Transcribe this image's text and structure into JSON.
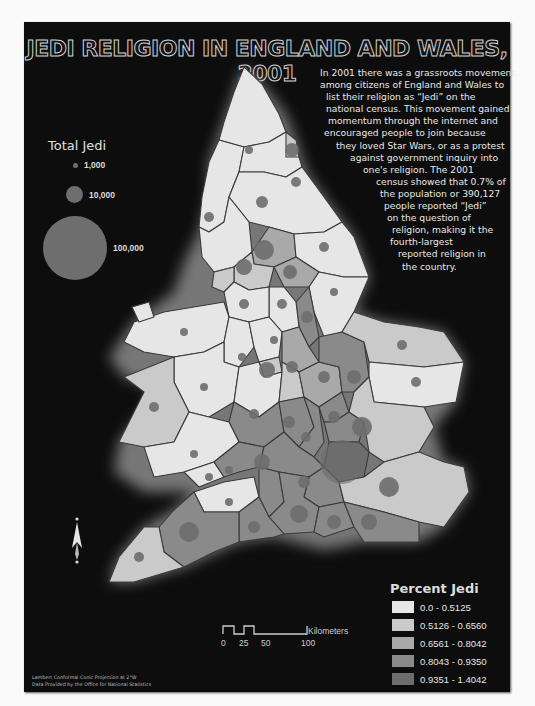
{
  "title": "JEDI RELIGION IN ENGLAND AND WALES, 2001",
  "intro_lines": [
    "In 2001 there was a grassroots movement",
    "among citizens of England and Wales to",
    "list their religion as “Jedi” on the",
    "national census.  This movement gained",
    "momentum through the internet and",
    "encouraged people to join because",
    "they loved Star Wars, or as a protest",
    "against government inquiry into",
    "one's religion.  The 2001",
    "census showed that 0.7% of",
    "the population or 390,127",
    "people reported “Jedi”",
    "on the question of",
    "religion, making it the",
    "fourth-largest",
    "reported religion in",
    "the country."
  ],
  "total_jedi_legend": {
    "title": "Total Jedi",
    "items": [
      {
        "label": "1,000",
        "diameter": 5
      },
      {
        "label": "10,000",
        "diameter": 17
      },
      {
        "label": "100,000",
        "diameter": 64
      }
    ]
  },
  "percent_jedi_legend": {
    "title": "Percent Jedi",
    "classes": [
      {
        "label": "0.0 - 0.5125",
        "color": "#e6e6e6"
      },
      {
        "label": "0.5126 - 0.6560",
        "color": "#cacaca"
      },
      {
        "label": "0.6561 - 0.8042",
        "color": "#a9a9a9"
      },
      {
        "label": "0.8043 - 0.9350",
        "color": "#8a8a8a"
      },
      {
        "label": "0.9351 - 1.4042",
        "color": "#6d6d6d"
      }
    ]
  },
  "scale_bar": {
    "unit": "Kilometers",
    "ticks": [
      "0",
      "25",
      "50",
      "100"
    ]
  },
  "credits": [
    "Lambert Conformal Conic Projection at 2°W",
    "Data Provided by the Office for National Statistics"
  ],
  "north_arrow": {
    "label": "N"
  },
  "colors": {
    "panel": "#0d0d0d",
    "boundary": "#3a3a3a",
    "bubble": "#6e6e6e"
  }
}
